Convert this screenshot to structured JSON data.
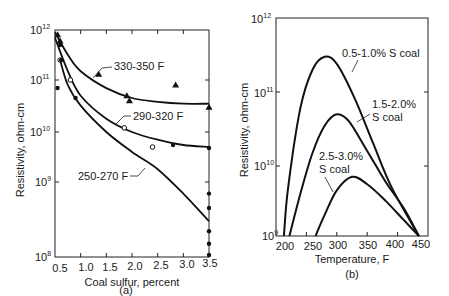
{
  "chart_data": [
    {
      "type": "line",
      "panel": "(a)",
      "xlabel": "Coal sulfur, percent",
      "ylabel": "Resistivity, ohm-cm",
      "xlim": [
        0.5,
        3.5
      ],
      "ylim": [
        100000000.0,
        1000000000000.0
      ],
      "yscale": "log",
      "xticks": [
        "0.5",
        "1.0",
        "1.5",
        "2.0",
        "2.5",
        "3.0",
        "3.5"
      ],
      "yticks": [
        "10^8",
        "10^9",
        "10^10",
        "10^11",
        "10^12"
      ],
      "series": [
        {
          "name": "330-350 F",
          "marker": "triangle",
          "x": [
            0.5,
            0.75,
            1.0,
            1.5,
            2.0,
            2.5,
            3.0,
            3.5
          ],
          "y": [
            900000000000.0,
            320000000000.0,
            150000000000.0,
            70000000000.0,
            45000000000.0,
            38000000000.0,
            35000000000.0,
            35000000000.0
          ],
          "points": {
            "x": [
              0.55,
              0.6,
              1.35,
              1.9,
              1.95,
              2.85,
              3.5
            ],
            "y": [
              800000000000.0,
              600000000000.0,
              130000000000.0,
              50000000000.0,
              40000000000.0,
              80000000000.0,
              30000000000.0
            ]
          }
        },
        {
          "name": "290-320 F",
          "marker": "circle-open",
          "x": [
            0.5,
            0.75,
            1.0,
            1.5,
            2.0,
            2.5,
            3.0,
            3.5
          ],
          "y": [
            700000000000.0,
            150000000000.0,
            50000000000.0,
            18000000000.0,
            10000000000.0,
            7000000000.0,
            5500000000.0,
            5000000000.0
          ],
          "points": {
            "x": [
              0.6,
              0.8,
              1.85,
              2.4
            ],
            "y": [
              250000000000.0,
              100000000000.0,
              12000000000.0,
              5000000000.0
            ]
          }
        },
        {
          "name": "250-270 F",
          "marker": "circle-filled",
          "x": [
            0.6,
            0.75,
            1.0,
            1.5,
            2.0,
            2.5,
            3.0,
            3.5
          ],
          "y": [
            250000000000.0,
            80000000000.0,
            32000000000.0,
            10000000000.0,
            4000000000.0,
            1800000000.0,
            700000000.0,
            300000000.0
          ],
          "points": {
            "x": [
              0.55,
              0.6,
              0.62,
              0.9,
              2.8,
              3.5,
              3.5,
              3.5,
              3.5,
              3.5,
              3.5
            ],
            "y": [
              70000000000.0,
              500000000000.0,
              250000000000.0,
              45000000000.0,
              5500000000.0,
              4800000000.0,
              700000000.0,
              450000000.0,
              220000000.0,
              150000000.0,
              100000000.0
            ]
          }
        }
      ]
    },
    {
      "type": "line",
      "panel": "(b)",
      "xlabel": "Temperature, F",
      "ylabel": "Resistivity, ohm-cm",
      "xlim": [
        200,
        450
      ],
      "ylim": [
        1000000000.0,
        1000000000000.0
      ],
      "yscale": "log",
      "xticks": [
        "200",
        "250",
        "300",
        "350",
        "400",
        "450"
      ],
      "yticks": [
        "10^9",
        "10^10",
        "10^11",
        "10^12"
      ],
      "series": [
        {
          "name": "0.5-1.0% S coal",
          "peak": {
            "x": 280,
            "y": 300000000000.0
          },
          "x": [
            213,
            220,
            240,
            260,
            280,
            300,
            330,
            360,
            390,
            435
          ],
          "y": [
            1000000000.0,
            5000000000.0,
            60000000000.0,
            200000000000.0,
            300000000000.0,
            240000000000.0,
            80000000000.0,
            20000000000.0,
            5000000000.0,
            1000000000.0
          ]
        },
        {
          "name": "1.5-2.0% S coal",
          "peak": {
            "x": 300,
            "y": 50000000000.0
          },
          "x": [
            222,
            240,
            260,
            280,
            300,
            320,
            350,
            380,
            410,
            435
          ],
          "y": [
            1000000000.0,
            4000000000.0,
            15000000000.0,
            35000000000.0,
            50000000000.0,
            40000000000.0,
            16000000000.0,
            6000000000.0,
            2500000000.0,
            1000000000.0
          ]
        },
        {
          "name": "2.5-3.0% S coal",
          "peak": {
            "x": 325,
            "y": 7000000000.0
          },
          "x": [
            265,
            280,
            300,
            325,
            350,
            380,
            410,
            435
          ],
          "y": [
            1000000000.0,
            2000000000.0,
            4500000000.0,
            7000000000.0,
            5500000000.0,
            3200000000.0,
            1700000000.0,
            1000000000.0
          ]
        }
      ]
    }
  ],
  "panel_a": {
    "y_tick_labels": [
      {
        "base": "10",
        "exp": "12"
      },
      {
        "base": "10",
        "exp": "11"
      },
      {
        "base": "10",
        "exp": "10"
      },
      {
        "base": "10",
        "exp": "9"
      },
      {
        "base": "10",
        "exp": "8"
      }
    ],
    "x_tick_labels": [
      "0.5",
      "1.0",
      "1.5",
      "2.0",
      "2.5",
      "3.0",
      "3.5"
    ],
    "ylabel": "Resistivity, ohm-cm",
    "xlabel": "Coal sulfur, percent",
    "caption": "(a)",
    "annotations": [
      "330-350 F",
      "290-320 F",
      "250-270 F"
    ]
  },
  "panel_b": {
    "y_tick_labels": [
      {
        "base": "10",
        "exp": "12"
      },
      {
        "base": "10",
        "exp": "11"
      },
      {
        "base": "10",
        "exp": "10"
      },
      {
        "base": "10",
        "exp": "9"
      }
    ],
    "x_tick_labels": [
      "200",
      "250",
      "300",
      "350",
      "400",
      "450"
    ],
    "ylabel": "Resistivity, ohm-cm",
    "xlabel": "Temperature, F",
    "caption": "(b)",
    "annotations": [
      "0.5-1.0% S coal",
      "1.5-2.0%",
      "S coal",
      "2.5-3.0%",
      "S coal"
    ]
  }
}
